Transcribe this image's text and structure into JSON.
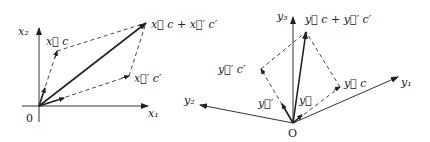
{
  "left_diagram": {
    "axes": {
      "horizontal_label": "x₁",
      "vertical_label": "x₂",
      "origin_label": "0"
    },
    "vectors": {
      "component_1_label": "x⃗ c",
      "component_2_label": "x⃗′ c′",
      "sum_label": "x⃗ c + x⃗′ c′"
    }
  },
  "right_diagram": {
    "axes": {
      "y1_label": "y₁",
      "y2_label": "y₂",
      "y3_label": "y₃",
      "origin_label": "O"
    },
    "vectors": {
      "basis_1_label": "y⃗",
      "basis_2_label": "y⃗′",
      "component_1_label": "y⃗ c",
      "component_2_label": "y⃗′ c′",
      "sum_label": "y⃗ c + y⃗′ c′"
    }
  }
}
